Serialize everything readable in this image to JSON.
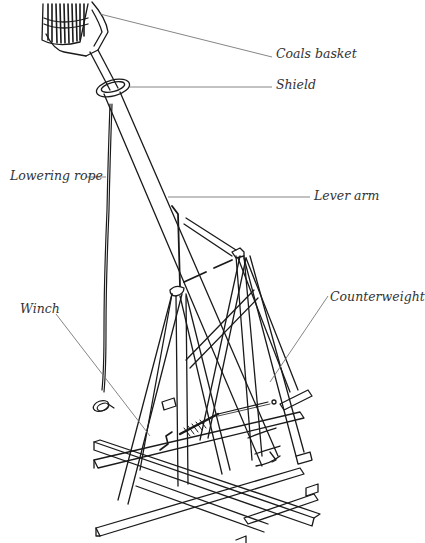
{
  "diagram": {
    "style": {
      "ink_color": "#1a1a1a",
      "leader_color": "#777777",
      "label_color": "#333333",
      "background": "#ffffff"
    },
    "labels": {
      "coals_basket": "Coals basket",
      "shield": "Shield",
      "lowering_rope": "Lowering rope",
      "lever_arm": "Lever arm",
      "winch": "Winch",
      "counterweight": "Counterweight"
    },
    "label_positions": {
      "coals_basket": {
        "x": 276,
        "y": 47
      },
      "shield": {
        "x": 276,
        "y": 79
      },
      "lowering_rope": {
        "x": 10,
        "y": 167
      },
      "lever_arm": {
        "x": 314,
        "y": 187
      },
      "winch": {
        "x": 20,
        "y": 308
      },
      "counterweight": {
        "x": 330,
        "y": 290
      }
    }
  }
}
